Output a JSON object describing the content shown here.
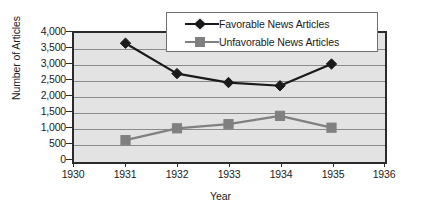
{
  "chart_data": {
    "type": "line",
    "title": "",
    "xlabel": "Year",
    "ylabel": "Number of Articles",
    "x": [
      1931,
      1932,
      1933,
      1934,
      1935
    ],
    "xlim": [
      1930,
      1936
    ],
    "ylim": [
      0,
      4000
    ],
    "xticks": [
      "1930",
      "1931",
      "1932",
      "1933",
      "1934",
      "1935",
      "1936"
    ],
    "yticks": [
      "0",
      "500",
      "1,000",
      "1,500",
      "2,000",
      "2,500",
      "3,000",
      "3,500",
      "4,000"
    ],
    "grid": "horizontal",
    "legend_position": "top-center",
    "series": [
      {
        "name": "Favorable News Articles",
        "marker": "diamond",
        "color": "#1a1a1a",
        "values": [
          3650,
          2700,
          2420,
          2320,
          3000
        ]
      },
      {
        "name": "Unfavorable News Articles",
        "marker": "square",
        "color": "#808080",
        "values": [
          620,
          990,
          1120,
          1380,
          1010
        ]
      }
    ]
  },
  "axes": {
    "y_title": "Number of Articles",
    "x_title": "Year",
    "y_tick_labels": [
      "4,000",
      "3,500",
      "3,000",
      "2,500",
      "2,000",
      "1,500",
      "1,000",
      "500",
      "0"
    ],
    "x_tick_labels": [
      "1930",
      "1931",
      "1932",
      "1933",
      "1934",
      "1935",
      "1936"
    ]
  },
  "legend": {
    "items": [
      {
        "label": "Favorable News Articles",
        "marker": "diamond-marker",
        "color": "#1a1a1a"
      },
      {
        "label": "Unfavorable News Articles",
        "marker": "square-marker",
        "color": "#808080"
      }
    ]
  },
  "colors": {
    "plot_background": "#e3e3e3",
    "gridline": "#8a8a8a",
    "axis": "#2b2b2b",
    "favorable": "#1a1a1a",
    "unfavorable": "#808080",
    "legend_background": "#ffffff"
  }
}
